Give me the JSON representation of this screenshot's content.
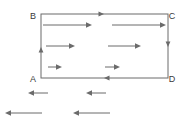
{
  "figure": {
    "name": "abcd-circulation-diagram",
    "type": "vector-line-diagram",
    "width": 186,
    "height": 125,
    "background_color": "#ffffff",
    "stroke_color": "#6b6b6b",
    "label_color": "#3a3a3a",
    "stroke_width": 1
  },
  "rectangle": {
    "name": "rectangle-abcd",
    "left": 41,
    "top": 14,
    "right": 168,
    "bottom": 78
  },
  "corner_labels": [
    {
      "id": "B",
      "text": "B",
      "x": 33,
      "y": 17,
      "corner": "top-left"
    },
    {
      "id": "C",
      "text": "C",
      "x": 172,
      "y": 17,
      "corner": "top-right"
    },
    {
      "id": "A",
      "text": "A",
      "x": 33,
      "y": 80,
      "corner": "bottom-left"
    },
    {
      "id": "D",
      "text": "D",
      "x": 172,
      "y": 80,
      "corner": "bottom-right"
    }
  ],
  "boundary_arrowheads": [
    {
      "id": "top-edge-arrowhead",
      "edge": "top",
      "direction": "right",
      "x": 104,
      "y": 14
    },
    {
      "id": "right-edge-arrowhead",
      "edge": "right",
      "direction": "down",
      "x": 168,
      "y": 47
    },
    {
      "id": "bottom-edge-arrowhead",
      "edge": "bottom",
      "direction": "left",
      "x": 104,
      "y": 78
    },
    {
      "id": "left-edge-arrowhead",
      "edge": "left",
      "direction": "up",
      "x": 41,
      "y": 47
    }
  ],
  "interior_arrows": [
    {
      "id": "interior-arrow-row1-col1",
      "row": 1,
      "direction": "right",
      "x1": 43,
      "x2": 92,
      "y": 25
    },
    {
      "id": "interior-arrow-row1-col2",
      "row": 1,
      "direction": "right",
      "x1": 112,
      "x2": 166,
      "y": 25
    },
    {
      "id": "interior-arrow-row2-col1",
      "row": 2,
      "direction": "right",
      "x1": 46,
      "x2": 75,
      "y": 46
    },
    {
      "id": "interior-arrow-row2-col2",
      "row": 2,
      "direction": "right",
      "x1": 108,
      "x2": 141,
      "y": 46
    },
    {
      "id": "interior-arrow-row3-col1",
      "row": 3,
      "direction": "right",
      "x1": 48,
      "x2": 62,
      "y": 67
    },
    {
      "id": "interior-arrow-row3-col2",
      "row": 3,
      "direction": "right",
      "x1": 105,
      "x2": 120,
      "y": 67
    }
  ],
  "exterior_arrows": [
    {
      "id": "exterior-arrow-upper-left",
      "row": 1,
      "direction": "left",
      "x1": 48,
      "x2": 28,
      "y": 93
    },
    {
      "id": "exterior-arrow-upper-right",
      "row": 1,
      "direction": "left",
      "x1": 106,
      "x2": 86,
      "y": 93
    },
    {
      "id": "exterior-arrow-lower-left",
      "row": 2,
      "direction": "left",
      "x1": 42,
      "x2": 5,
      "y": 113
    },
    {
      "id": "exterior-arrow-lower-right",
      "row": 2,
      "direction": "left",
      "x1": 110,
      "x2": 73,
      "y": 113
    }
  ]
}
